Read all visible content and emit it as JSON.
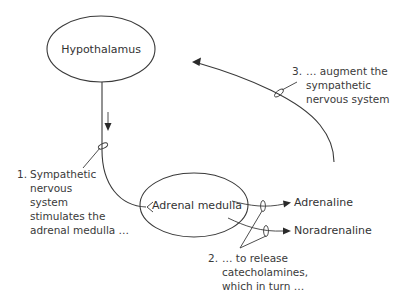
{
  "diagram": {
    "nodes": {
      "hypothalamus": "Hypothalamus",
      "adrenal_medulla": "Adrenal medulla",
      "adrenaline": "Adrenaline",
      "noradrenaline": "Noradrenaline"
    },
    "step1": {
      "number": "1.",
      "lines": [
        "Sympathetic",
        "nervous",
        "system",
        "stimulates the",
        "adrenal medulla …"
      ]
    },
    "step2": {
      "number": "2.",
      "lines": [
        "… to release",
        "catecholamines,",
        "which in turn …"
      ]
    },
    "step3": {
      "number": "3.",
      "lines": [
        "… augment the",
        "sympathetic",
        "nervous system"
      ]
    }
  }
}
